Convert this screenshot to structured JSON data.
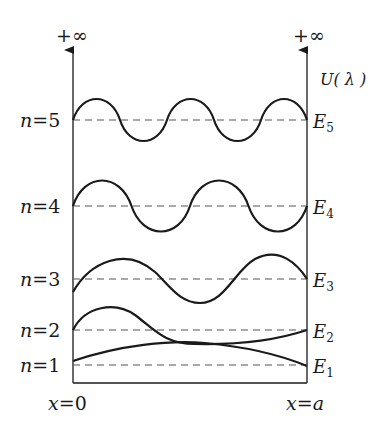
{
  "diagram": {
    "left_axis": {
      "top_label": "+∞"
    },
    "right_axis": {
      "top_label": "+∞",
      "potential_label": "U( λ )"
    },
    "x_labels": {
      "left": "x=0",
      "right": "x=a"
    },
    "levels": [
      {
        "n": 5,
        "n_label": "n=5",
        "energy_label": "E",
        "energy_sub": "5",
        "half_waves": 5
      },
      {
        "n": 4,
        "n_label": "n=4",
        "energy_label": "E",
        "energy_sub": "4",
        "half_waves": 4
      },
      {
        "n": 3,
        "n_label": "n=3",
        "energy_label": "E",
        "energy_sub": "3",
        "half_waves": 3
      },
      {
        "n": 2,
        "n_label": "n=2",
        "energy_label": "E",
        "energy_sub": "2",
        "half_waves": 2
      },
      {
        "n": 1,
        "n_label": "n=1",
        "energy_label": "E",
        "energy_sub": "1",
        "half_waves": 1
      }
    ],
    "colors": {
      "ink": "#1a1a1a",
      "dash": "#555555",
      "background": "#ffffff"
    }
  }
}
